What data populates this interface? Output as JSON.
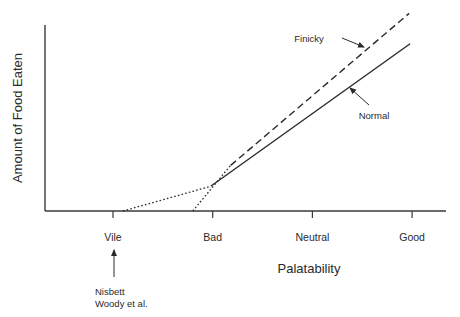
{
  "chart_data": {
    "type": "line",
    "title": "",
    "xlabel": "Palatability",
    "ylabel": "Amount of Food Eaten",
    "categories": [
      "Vile",
      "Bad",
      "Neutral",
      "Good"
    ],
    "x_range": [
      -0.68,
      3.34
    ],
    "y_range": [
      0,
      10
    ],
    "grid": false,
    "legend": "none",
    "series": [
      {
        "name": "Normal",
        "label": "Normal",
        "segments": [
          {
            "style": "dotted",
            "points": [
              [
                0.1,
                0.0
              ],
              [
                0.98,
                1.3
              ]
            ]
          },
          {
            "style": "solid",
            "points": [
              [
                0.98,
                1.3
              ],
              [
                2.98,
                8.8
              ]
            ]
          }
        ]
      },
      {
        "name": "Finicky",
        "label": "Finicky",
        "segments": [
          {
            "style": "dotted",
            "points": [
              [
                0.8,
                0.0
              ],
              [
                1.18,
                2.4
              ]
            ]
          },
          {
            "style": "dashed",
            "points": [
              [
                1.18,
                2.4
              ],
              [
                2.97,
                10.4
              ]
            ]
          }
        ]
      }
    ],
    "annotations": [
      {
        "text": "Finicky",
        "points_to": "Finicky"
      },
      {
        "text": "Normal",
        "points_to": "Normal"
      },
      {
        "text": "Nisbett",
        "line2": "Woody et al.",
        "points_to": "Vile"
      }
    ]
  }
}
